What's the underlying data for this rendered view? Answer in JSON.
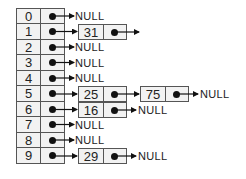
{
  "diagram": {
    "type": "hash-table-separate-chaining",
    "null_label": "NULL",
    "buckets": [
      {
        "index": "0",
        "chain": []
      },
      {
        "index": "1",
        "chain": [
          "31"
        ],
        "trailing_arrow": "continues"
      },
      {
        "index": "2",
        "chain": []
      },
      {
        "index": "3",
        "chain": []
      },
      {
        "index": "4",
        "chain": []
      },
      {
        "index": "5",
        "chain": [
          "25",
          "75"
        ]
      },
      {
        "index": "6",
        "chain": [
          "16"
        ]
      },
      {
        "index": "7",
        "chain": []
      },
      {
        "index": "8",
        "chain": []
      },
      {
        "index": "9",
        "chain": [
          "29"
        ]
      }
    ],
    "labels": {
      "b0": "0",
      "b1": "1",
      "b2": "2",
      "b3": "3",
      "b4": "4",
      "b5": "5",
      "b6": "6",
      "b7": "7",
      "b8": "8",
      "b9": "9",
      "n31": "31",
      "n25": "25",
      "n75": "75",
      "n16": "16",
      "n29": "29",
      "null": "NULL"
    },
    "colors": {
      "border": "#555555",
      "fill": "#f2f2f2",
      "ink": "#111111"
    }
  }
}
